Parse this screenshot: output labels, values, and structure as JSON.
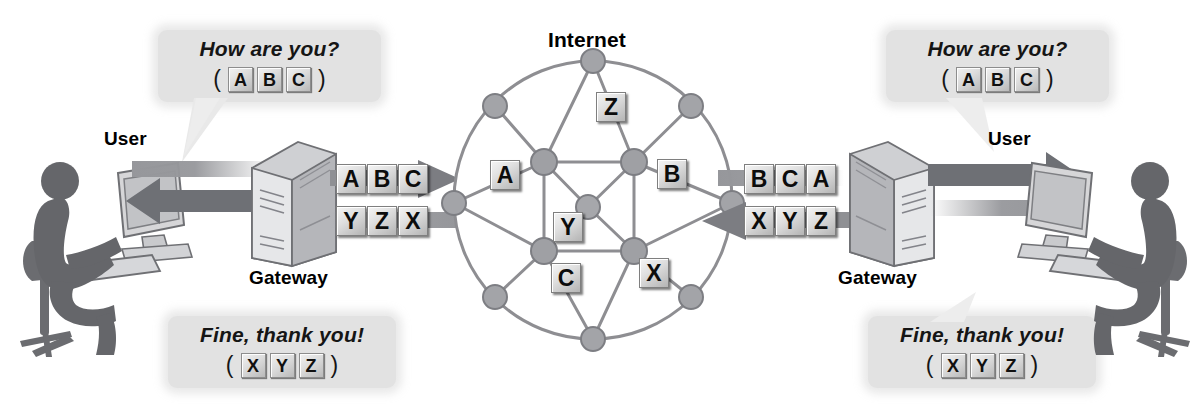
{
  "diagram": {
    "title_internet": "Internet",
    "nodes": {
      "user_left_label": "User",
      "user_right_label": "User",
      "gateway_left_label": "Gateway",
      "gateway_right_label": "Gateway"
    },
    "bubbles": {
      "top_left": {
        "text": "How are you?",
        "open_paren": "(",
        "close_paren": ")",
        "packets": [
          "A",
          "B",
          "C"
        ]
      },
      "bottom_left": {
        "text": "Fine, thank you!",
        "open_paren": "(",
        "close_paren": ")",
        "packets": [
          "X",
          "Y",
          "Z"
        ]
      },
      "top_right": {
        "text": "How are you?",
        "open_paren": "(",
        "close_paren": ")",
        "packets": [
          "A",
          "B",
          "C"
        ]
      },
      "bottom_right": {
        "text": "Fine, thank you!",
        "open_paren": "(",
        "close_paren": ")",
        "packets": [
          "X",
          "Y",
          "Z"
        ]
      }
    },
    "streams": {
      "left_outbound": [
        "A",
        "B",
        "C"
      ],
      "left_inbound": [
        "Y",
        "Z",
        "X"
      ],
      "right_inbound": [
        "B",
        "C",
        "A"
      ],
      "right_outbound": [
        "X",
        "Y",
        "Z"
      ]
    },
    "cloud_packets": [
      {
        "label": "Z",
        "x": 596,
        "y": 92
      },
      {
        "label": "A",
        "x": 490,
        "y": 160
      },
      {
        "label": "B",
        "x": 657,
        "y": 159
      },
      {
        "label": "Y",
        "x": 553,
        "y": 212
      },
      {
        "label": "C",
        "x": 551,
        "y": 263
      },
      {
        "label": "X",
        "x": 639,
        "y": 258
      }
    ],
    "colors": {
      "packet_fill": "#e0e0e0",
      "packet_border": "#7f7f7f",
      "bubble_bg": "#e2e2e2",
      "arrow_gray": "#8f9094",
      "arrow_dark": "#6e7075",
      "node_gray": "#9a9a9e",
      "link_gray": "#8e8e92",
      "text_black": "#000000"
    }
  }
}
